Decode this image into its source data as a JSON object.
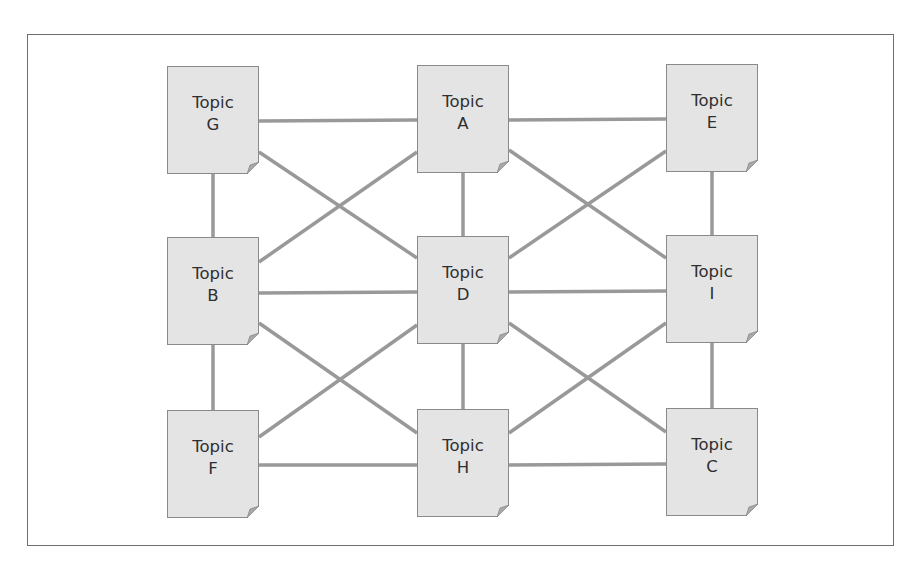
{
  "diagram": {
    "type": "network",
    "line_color": "#999999",
    "box_fill": "#e4e4e4",
    "nodes": [
      {
        "id": "G",
        "line1": "Topic",
        "line2": "G",
        "x": 167,
        "y": 66
      },
      {
        "id": "A",
        "line1": "Topic",
        "line2": "A",
        "x": 417,
        "y": 65
      },
      {
        "id": "E",
        "line1": "Topic",
        "line2": "E",
        "x": 666,
        "y": 64
      },
      {
        "id": "B",
        "line1": "Topic",
        "line2": "B",
        "x": 167,
        "y": 237
      },
      {
        "id": "D",
        "line1": "Topic",
        "line2": "D",
        "x": 417,
        "y": 236
      },
      {
        "id": "I",
        "line1": "Topic",
        "line2": "I",
        "x": 666,
        "y": 235
      },
      {
        "id": "F",
        "line1": "Topic",
        "line2": "F",
        "x": 167,
        "y": 410
      },
      {
        "id": "H",
        "line1": "Topic",
        "line2": "H",
        "x": 417,
        "y": 409
      },
      {
        "id": "C",
        "line1": "Topic",
        "line2": "C",
        "x": 666,
        "y": 408
      }
    ],
    "edges": [
      [
        "G",
        "A"
      ],
      [
        "A",
        "E"
      ],
      [
        "B",
        "D"
      ],
      [
        "D",
        "I"
      ],
      [
        "F",
        "H"
      ],
      [
        "H",
        "C"
      ],
      [
        "G",
        "B"
      ],
      [
        "B",
        "F"
      ],
      [
        "A",
        "D"
      ],
      [
        "D",
        "H"
      ],
      [
        "E",
        "I"
      ],
      [
        "I",
        "C"
      ],
      [
        "G",
        "D"
      ],
      [
        "B",
        "A"
      ],
      [
        "A",
        "I"
      ],
      [
        "D",
        "E"
      ],
      [
        "B",
        "H"
      ],
      [
        "F",
        "D"
      ],
      [
        "D",
        "C"
      ],
      [
        "H",
        "I"
      ]
    ]
  }
}
